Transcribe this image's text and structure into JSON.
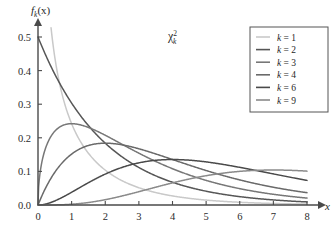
{
  "chart_data": {
    "type": "line",
    "title": "",
    "annotation": {
      "base": "χ",
      "superscript": "2",
      "subscript": "k"
    },
    "ylabel": "f",
    "ylabel_sub": "k",
    "ylabel_arg": "(x)",
    "xlabel": "x",
    "xlim": [
      0,
      8
    ],
    "ylim": [
      0,
      0.5
    ],
    "grid": false,
    "legend_position": "top-right",
    "xticks": [
      "0",
      "1",
      "2",
      "3",
      "4",
      "5",
      "6",
      "7",
      "8"
    ],
    "xtick_values": [
      0,
      1,
      2,
      3,
      4,
      5,
      6,
      7,
      8
    ],
    "yticks": [
      "0.0",
      "0.1",
      "0.2",
      "0.3",
      "0.4",
      "0.5"
    ],
    "ytick_values": [
      0.0,
      0.1,
      0.2,
      0.3,
      0.4,
      0.5
    ],
    "series": [
      {
        "name": "k = 1",
        "k": 1,
        "color": "#c9c9c9",
        "x": [
          0.05,
          0.1,
          0.2,
          0.3,
          0.4,
          0.5,
          0.75,
          1,
          1.5,
          2,
          2.5,
          3,
          3.5,
          4,
          5,
          6,
          7,
          8
        ],
        "values": [
          1.7,
          1.2,
          0.8,
          0.627,
          0.527,
          0.439,
          0.31,
          0.242,
          0.154,
          0.104,
          0.072,
          0.051,
          0.037,
          0.027,
          0.014,
          0.0081,
          0.0046,
          0.0027
        ]
      },
      {
        "name": "k = 2",
        "k": 2,
        "color": "#565656",
        "x": [
          0,
          0.5,
          1,
          1.5,
          2,
          2.5,
          3,
          3.5,
          4,
          5,
          6,
          7,
          8
        ],
        "values": [
          0.5,
          0.389,
          0.303,
          0.236,
          0.184,
          0.143,
          0.112,
          0.087,
          0.068,
          0.041,
          0.025,
          0.015,
          0.009
        ]
      },
      {
        "name": "k = 3",
        "k": 3,
        "color": "#777777",
        "x": [
          0,
          0.25,
          0.5,
          1,
          1.5,
          2,
          2.5,
          3,
          4,
          5,
          6,
          7,
          8
        ],
        "values": [
          0,
          0.176,
          0.219,
          0.242,
          0.232,
          0.207,
          0.18,
          0.154,
          0.108,
          0.073,
          0.049,
          0.032,
          0.021
        ]
      },
      {
        "name": "k = 4",
        "k": 4,
        "color": "#6a6a6a",
        "x": [
          0,
          0.5,
          1,
          1.5,
          2,
          2.5,
          3,
          3.5,
          4,
          5,
          6,
          7,
          8
        ],
        "values": [
          0,
          0.097,
          0.152,
          0.177,
          0.184,
          0.179,
          0.167,
          0.152,
          0.135,
          0.102,
          0.075,
          0.053,
          0.037
        ]
      },
      {
        "name": "k = 6",
        "k": 6,
        "color": "#4a4a4a",
        "x": [
          0,
          1,
          2,
          3,
          4,
          5,
          6,
          7,
          8
        ],
        "values": [
          0,
          0.0379,
          0.092,
          0.1255,
          0.1353,
          0.1282,
          0.112,
          0.0925,
          0.0733
        ]
      },
      {
        "name": "k = 9",
        "k": 9,
        "color": "#8a8a8a",
        "x": [
          0,
          1,
          2,
          3,
          4,
          5,
          6,
          7,
          8
        ],
        "values": [
          0,
          0.004,
          0.0183,
          0.0377,
          0.0571,
          0.072,
          0.0812,
          0.085,
          0.0843
        ]
      }
    ]
  },
  "legend": {
    "items": [
      {
        "label": "k = 1",
        "k_text": "k",
        "eq_text": " = 1"
      },
      {
        "label": "k = 2",
        "k_text": "k",
        "eq_text": " = 2"
      },
      {
        "label": "k = 3",
        "k_text": "k",
        "eq_text": " = 3"
      },
      {
        "label": "k = 4",
        "k_text": "k",
        "eq_text": " = 4"
      },
      {
        "label": "k = 6",
        "k_text": "k",
        "eq_text": " = 6"
      },
      {
        "label": "k = 9",
        "k_text": "k",
        "eq_text": " = 9"
      }
    ]
  }
}
